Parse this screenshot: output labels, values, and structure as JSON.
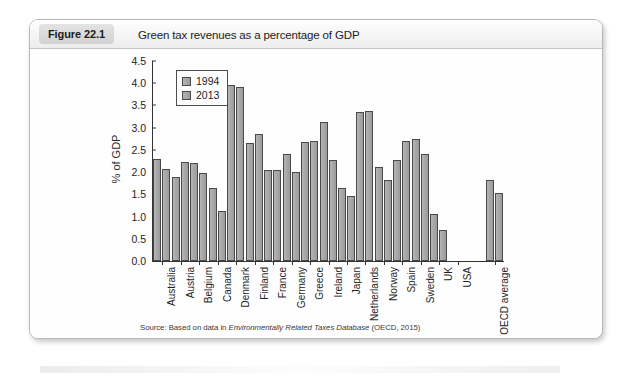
{
  "page": {
    "top_bleed_text": "",
    "badge_label": "Figure 22.1",
    "caption": "Green tax revenues as a percentage of GDP",
    "source_prefix": "Source: Based on data in",
    "source_italic": "Environmentally Related Taxes Database",
    "source_suffix": "(OECD, 2015)"
  },
  "chart_data": {
    "type": "bar",
    "title": "Green tax revenues as a percentage of GDP",
    "xlabel": "",
    "ylabel": "% of GDP",
    "ylim": [
      0.0,
      4.5
    ],
    "ytick_values": [
      0.0,
      0.5,
      1.0,
      1.5,
      2.0,
      2.5,
      3.0,
      3.5,
      4.0,
      4.5
    ],
    "ytick_labels": [
      "0.0",
      "0.5",
      "1.0",
      "1.5",
      "2.0",
      "2.5",
      "3.0",
      "3.5",
      "4.0",
      "4.5"
    ],
    "grid": false,
    "legend_position": "upper-left-inside",
    "categories": [
      "Australia",
      "Austria",
      "Belgium",
      "Canada",
      "Denmark",
      "Finland",
      "France",
      "Germany",
      "Greece",
      "Ireland",
      "Japan",
      "Netherlands",
      "Norway",
      "Spain",
      "Sweden",
      "UK",
      "USA",
      "",
      "OECD average"
    ],
    "series": [
      {
        "name": "1994",
        "color": "#a8a8a8",
        "values": [
          2.3,
          1.9,
          2.2,
          1.65,
          3.97,
          2.66,
          2.05,
          2.4,
          2.67,
          3.13,
          1.65,
          3.35,
          2.12,
          2.28,
          2.74,
          1.05,
          null,
          null,
          1.82
        ]
      },
      {
        "name": "2013",
        "color": "#a8a8a8",
        "values": [
          2.07,
          2.23,
          1.98,
          1.12,
          3.91,
          2.85,
          2.04,
          2.0,
          2.7,
          2.27,
          1.47,
          3.38,
          1.83,
          2.7,
          2.4,
          0.7,
          null,
          null,
          1.52
        ]
      }
    ]
  }
}
